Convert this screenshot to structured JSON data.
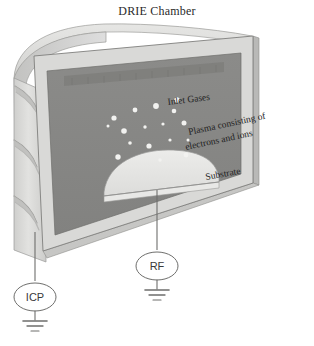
{
  "figure": {
    "title": "DRIE Chamber",
    "type": "technical-schematic",
    "background_color": "#ffffff"
  },
  "labels": {
    "inlet_gases": "Inlet Gases",
    "plasma_line1": "Plasma consisting of",
    "plasma_line2": "electrons and ions",
    "substrate": "Substrate"
  },
  "nodes": {
    "icp": {
      "label": "ICP",
      "ground": "ground-symbol"
    },
    "rf": {
      "label": "RF",
      "ground": "ground-symbol"
    }
  },
  "colors": {
    "chamber_body": "#d9d9d7",
    "chamber_body_shadow": "#c4c4c2",
    "chamber_frame": "#cfcfcd",
    "chamber_interior": "#868684",
    "chamber_interior_top_band": "#7b7b79",
    "substrate_dome": "#e4e4e2",
    "plasma_particle": "#f2f2f0",
    "outline": "#7a7a78",
    "wire": "#6e6e6e",
    "text": "#1f1f1f"
  },
  "elements": {
    "coil_count": 3,
    "plasma_particle_count": 17,
    "substrate_dome": "dome",
    "icp_wire": "vertical-wire",
    "rf_wire": "vertical-wire"
  },
  "plasma_particles": [
    {
      "cx": 114,
      "cy": 118,
      "r": 2.6
    },
    {
      "cx": 135,
      "cy": 110,
      "r": 2.4
    },
    {
      "cx": 156,
      "cy": 106,
      "r": 2.9
    },
    {
      "cx": 174,
      "cy": 111,
      "r": 2.3
    },
    {
      "cx": 177,
      "cy": 100,
      "r": 2.7
    },
    {
      "cx": 124,
      "cy": 131,
      "r": 2.8
    },
    {
      "cx": 145,
      "cy": 127,
      "r": 1.7
    },
    {
      "cx": 163,
      "cy": 124,
      "r": 1.6
    },
    {
      "cx": 184,
      "cy": 123,
      "r": 2.5
    },
    {
      "cx": 108,
      "cy": 126,
      "r": 1.5
    },
    {
      "cx": 130,
      "cy": 143,
      "r": 1.8
    },
    {
      "cx": 149,
      "cy": 146,
      "r": 2.6
    },
    {
      "cx": 170,
      "cy": 140,
      "r": 1.6
    },
    {
      "cx": 188,
      "cy": 140,
      "r": 1.5
    },
    {
      "cx": 118,
      "cy": 157,
      "r": 2.7
    },
    {
      "cx": 160,
      "cy": 160,
      "r": 1.7
    },
    {
      "cx": 186,
      "cy": 155,
      "r": 2.4
    }
  ]
}
